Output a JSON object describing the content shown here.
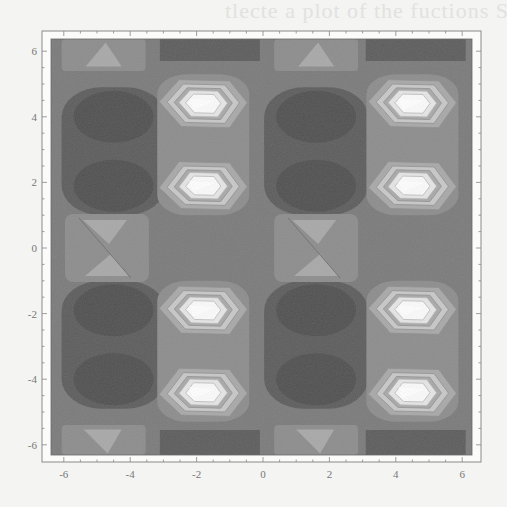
{
  "chart_data": {
    "type": "heatmap",
    "subtype": "contour",
    "title": "",
    "xlabel": "",
    "ylabel": "",
    "xlim": [
      -6.4,
      6.4
    ],
    "ylim": [
      -6.4,
      6.4
    ],
    "x_ticks": [
      "-6",
      "-4",
      "-2",
      "0",
      "2",
      "4",
      "6"
    ],
    "y_ticks": [
      "6",
      "4",
      "2",
      "0",
      "-2",
      "-4",
      "-6"
    ],
    "x_tick_values": [
      -6,
      -4,
      -2,
      0,
      2,
      4,
      6
    ],
    "y_tick_values": [
      6,
      4,
      2,
      0,
      -2,
      -4,
      -6
    ],
    "grid": false,
    "legend": null,
    "colormap": "grayscale (dark = low, white = high)",
    "contour_levels": 8,
    "peaks": [
      {
        "x": -1.8,
        "y": 4.4,
        "level": "max"
      },
      {
        "x": -1.8,
        "y": 1.9,
        "level": "max"
      },
      {
        "x": -1.8,
        "y": -1.9,
        "level": "max"
      },
      {
        "x": -1.8,
        "y": -4.4,
        "level": "max"
      },
      {
        "x": 4.5,
        "y": 4.4,
        "level": "max"
      },
      {
        "x": 4.5,
        "y": 1.9,
        "level": "max"
      },
      {
        "x": 4.5,
        "y": -1.9,
        "level": "max"
      },
      {
        "x": 4.5,
        "y": -4.4,
        "level": "max"
      }
    ],
    "troughs": [
      {
        "x": -4.5,
        "y": 4.0
      },
      {
        "x": -4.5,
        "y": 2.0
      },
      {
        "x": 1.5,
        "y": 4.0
      },
      {
        "x": 1.5,
        "y": 2.0
      },
      {
        "x": -4.5,
        "y": -2.0
      },
      {
        "x": -4.5,
        "y": -4.0
      },
      {
        "x": 1.5,
        "y": -2.0
      },
      {
        "x": 1.5,
        "y": -4.0
      }
    ],
    "saddle_features": [
      {
        "x": -4.7,
        "y": 0.0,
        "shape": "hourglass"
      },
      {
        "x": 1.6,
        "y": 0.0,
        "shape": "hourglass"
      },
      {
        "x": -4.8,
        "y": 5.9,
        "shape": "triangle-up"
      },
      {
        "x": 1.6,
        "y": 5.9,
        "shape": "triangle-up"
      },
      {
        "x": -4.8,
        "y": -5.9,
        "shape": "triangle-down"
      },
      {
        "x": 1.6,
        "y": -5.9,
        "shape": "triangle-down"
      }
    ],
    "colors": {
      "level0": "#505050",
      "level1": "#5c5c5c",
      "level2": "#6a6a6a",
      "level3": "#7a7a7a",
      "level4": "#8c8c8c",
      "level5": "#a8a8a8",
      "level6": "#c8c8c8",
      "level7": "#e6e6e6",
      "level8": "#fbfbfb",
      "background": "#f4f4f2",
      "frame": "#8a8a8a"
    }
  },
  "page_bleed_text": "tlecte a plot of the fuctions Sin(x)"
}
